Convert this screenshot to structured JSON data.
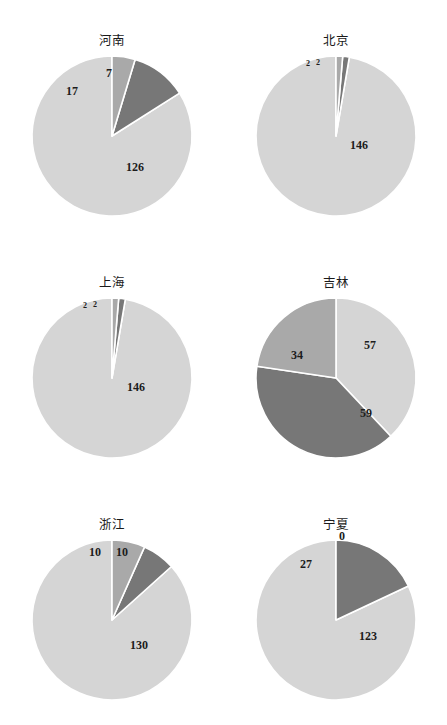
{
  "figure": {
    "background_color": "#ffffff",
    "layout": "2 columns x 3 rows of pie charts"
  },
  "palette": {
    "light": "#d5d5d5",
    "medium": "#a9a9a9",
    "dark": "#777777",
    "separator": "#ffffff",
    "label_text": "#1c1c1c",
    "title_text": "#1a1a1a"
  },
  "chart_data": [
    {
      "type": "pie",
      "title": "河南",
      "labels": [
        "126",
        "17",
        "7"
      ],
      "values": [
        126,
        17,
        7
      ],
      "colors": [
        "#d5d5d5",
        "#777777",
        "#a9a9a9"
      ],
      "total": 150,
      "start_angle_deg": 0,
      "direction": "counterclockwise",
      "legend": "none",
      "label_positions": [
        {
          "text": "126",
          "x": 135,
          "y": 168,
          "size": "normal"
        },
        {
          "text": "17",
          "x": 72,
          "y": 92,
          "size": "normal"
        },
        {
          "text": "7",
          "x": 109,
          "y": 74,
          "size": "normal"
        }
      ]
    },
    {
      "type": "pie",
      "title": "北京",
      "labels": [
        "146",
        "2",
        "2"
      ],
      "values": [
        146,
        2,
        2
      ],
      "colors": [
        "#d5d5d5",
        "#777777",
        "#a9a9a9"
      ],
      "total": 150,
      "start_angle_deg": 0,
      "direction": "counterclockwise",
      "legend": "none",
      "label_positions": [
        {
          "text": "146",
          "x": 136,
          "y": 146,
          "size": "normal"
        },
        {
          "text": "2",
          "x": 85,
          "y": 64,
          "size": "tiny"
        },
        {
          "text": "2",
          "x": 95,
          "y": 63,
          "size": "tiny"
        }
      ]
    },
    {
      "type": "pie",
      "title": "上海",
      "labels": [
        "146",
        "2",
        "2"
      ],
      "values": [
        146,
        2,
        2
      ],
      "colors": [
        "#d5d5d5",
        "#777777",
        "#a9a9a9"
      ],
      "total": 150,
      "start_angle_deg": 0,
      "direction": "counterclockwise",
      "legend": "none",
      "label_positions": [
        {
          "text": "146",
          "x": 136,
          "y": 146,
          "size": "normal"
        },
        {
          "text": "2",
          "x": 85,
          "y": 64,
          "size": "tiny"
        },
        {
          "text": "2",
          "x": 95,
          "y": 63,
          "size": "tiny"
        }
      ]
    },
    {
      "type": "pie",
      "title": "吉林",
      "labels": [
        "57",
        "59",
        "34"
      ],
      "values": [
        57,
        59,
        34
      ],
      "colors": [
        "#d5d5d5",
        "#777777",
        "#a9a9a9"
      ],
      "total": 150,
      "start_angle_deg": 0,
      "direction": "clockwise",
      "legend": "none",
      "label_positions": [
        {
          "text": "57",
          "x": 147,
          "y": 104,
          "size": "normal"
        },
        {
          "text": "59",
          "x": 143,
          "y": 172,
          "size": "normal"
        },
        {
          "text": "34",
          "x": 74,
          "y": 114,
          "size": "normal"
        }
      ]
    },
    {
      "type": "pie",
      "title": "浙江",
      "labels": [
        "130",
        "10",
        "10"
      ],
      "values": [
        130,
        10,
        10
      ],
      "colors": [
        "#d5d5d5",
        "#777777",
        "#a9a9a9"
      ],
      "total": 150,
      "start_angle_deg": 0,
      "direction": "counterclockwise",
      "legend": "none",
      "label_positions": [
        {
          "text": "130",
          "x": 139,
          "y": 162,
          "size": "normal"
        },
        {
          "text": "10",
          "x": 95,
          "y": 69,
          "size": "normal"
        },
        {
          "text": "10",
          "x": 122,
          "y": 69,
          "size": "normal"
        }
      ]
    },
    {
      "type": "pie",
      "title": "宁夏",
      "labels": [
        "123",
        "27",
        "0"
      ],
      "values": [
        123,
        27,
        0
      ],
      "colors": [
        "#d5d5d5",
        "#777777",
        "#a9a9a9"
      ],
      "total": 150,
      "start_angle_deg": 0,
      "direction": "counterclockwise",
      "legend": "none",
      "label_positions": [
        {
          "text": "123",
          "x": 145,
          "y": 153,
          "size": "normal"
        },
        {
          "text": "27",
          "x": 83,
          "y": 81,
          "size": "normal"
        },
        {
          "text": "0",
          "x": 119,
          "y": 53,
          "size": "normal"
        }
      ]
    }
  ],
  "geometry": {
    "cells": [
      {
        "cx": 112,
        "cy": 136,
        "r": 80,
        "title_x": 112,
        "title_y": 45
      },
      {
        "cx": 113,
        "cy": 136,
        "r": 80,
        "title_x": 113,
        "title_y": 45
      },
      {
        "cx": 112,
        "cy": 136,
        "r": 80,
        "title_x": 112,
        "title_y": 45
      },
      {
        "cx": 113,
        "cy": 136,
        "r": 80,
        "title_x": 113,
        "title_y": 45
      },
      {
        "cx": 112,
        "cy": 136,
        "r": 80,
        "title_x": 112,
        "title_y": 45
      },
      {
        "cx": 113,
        "cy": 136,
        "r": 80,
        "title_x": 113,
        "title_y": 45
      }
    ]
  }
}
